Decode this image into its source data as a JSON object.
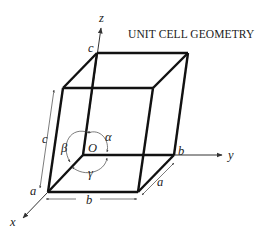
{
  "title": "UNIT CELL GEOMETRY",
  "axes": {
    "x": "x",
    "y": "y",
    "z": "z"
  },
  "origin": "O",
  "edges": {
    "a_left": "a",
    "a_right": "a",
    "b_bottom": "b",
    "b_axis": "b",
    "c_top": "c",
    "c_left": "c"
  },
  "angles": {
    "alpha": "α",
    "beta": "β",
    "gamma": "γ"
  },
  "colors": {
    "edge": "#111111",
    "thin": "#333333",
    "text": "#222222"
  }
}
